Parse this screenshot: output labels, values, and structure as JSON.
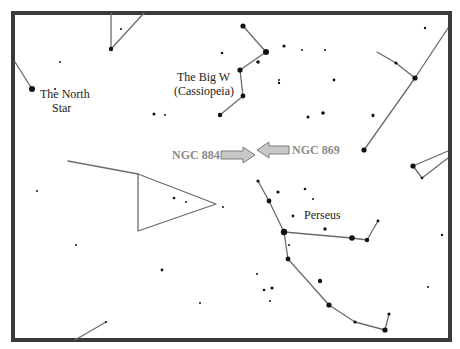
{
  "colors": {
    "frame": "#3a3a3a",
    "lines": "#6b6b6b",
    "stars": "#111111",
    "ngc_label": "#8a8a8a",
    "arrow_fill": "#c8c8c8"
  },
  "labels": {
    "north_star_line1": "The North",
    "north_star_line2": "Star",
    "cassiopeia_line1": "The Big W",
    "cassiopeia_line2": "(Cassiopeia)",
    "perseus": "Perseus",
    "ngc884": "NGC 884",
    "ngc869": "NGC 869"
  },
  "constellations": [
    {
      "name": "top-left-segment",
      "points": [
        [
          111,
          13
        ],
        [
          111,
          49
        ],
        [
          144,
          13
        ]
      ]
    },
    {
      "name": "north-star-line",
      "points": [
        [
          15,
          62
        ],
        [
          32,
          89
        ]
      ]
    },
    {
      "name": "cassiopeia",
      "points": [
        [
          243,
          26
        ],
        [
          266,
          52
        ],
        [
          240,
          70
        ],
        [
          243,
          96
        ],
        [
          220,
          115
        ]
      ]
    },
    {
      "name": "right-top",
      "points": [
        [
          377,
          52
        ],
        [
          396,
          63
        ],
        [
          415,
          78
        ]
      ]
    },
    {
      "name": "right-long",
      "points": [
        [
          448,
          28
        ],
        [
          415,
          78
        ],
        [
          364,
          150
        ]
      ]
    },
    {
      "name": "right-middle",
      "points": [
        [
          448,
          151
        ],
        [
          413,
          166
        ],
        [
          422,
          178
        ],
        [
          448,
          158
        ]
      ]
    },
    {
      "name": "left-line",
      "points": [
        [
          68,
          161
        ],
        [
          138,
          174
        ]
      ]
    },
    {
      "name": "triangle",
      "points": [
        [
          138,
          174
        ],
        [
          216,
          204
        ],
        [
          138,
          231
        ],
        [
          138,
          174
        ]
      ]
    },
    {
      "name": "perseus-arm",
      "points": [
        [
          258,
          181
        ],
        [
          269,
          201
        ],
        [
          284,
          232
        ],
        [
          352,
          238
        ],
        [
          367,
          240
        ],
        [
          378,
          221
        ]
      ]
    },
    {
      "name": "perseus-lower",
      "points": [
        [
          284,
          232
        ],
        [
          288,
          259
        ],
        [
          329,
          305
        ],
        [
          355,
          322
        ],
        [
          385,
          330
        ],
        [
          389,
          314
        ]
      ]
    },
    {
      "name": "bottom-left",
      "points": [
        [
          75,
          340
        ],
        [
          106,
          322
        ]
      ]
    }
  ],
  "stars": [
    {
      "x": 32,
      "y": 89,
      "r": 3
    },
    {
      "x": 111,
      "y": 49,
      "r": 2.2
    },
    {
      "x": 243,
      "y": 26,
      "r": 2.6
    },
    {
      "x": 266,
      "y": 52,
      "r": 3
    },
    {
      "x": 240,
      "y": 70,
      "r": 2.6
    },
    {
      "x": 243,
      "y": 96,
      "r": 2.4
    },
    {
      "x": 220,
      "y": 115,
      "r": 2.2
    },
    {
      "x": 258,
      "y": 62,
      "r": 1.8
    },
    {
      "x": 222,
      "y": 53,
      "r": 1.3
    },
    {
      "x": 284,
      "y": 46,
      "r": 1.6
    },
    {
      "x": 279,
      "y": 83,
      "r": 1.2
    },
    {
      "x": 154,
      "y": 114,
      "r": 1.5
    },
    {
      "x": 165,
      "y": 115,
      "r": 1
    },
    {
      "x": 308,
      "y": 117,
      "r": 1.5
    },
    {
      "x": 323,
      "y": 113,
      "r": 1.8
    },
    {
      "x": 373,
      "y": 115,
      "r": 1.5
    },
    {
      "x": 279,
      "y": 80,
      "r": 1
    },
    {
      "x": 334,
      "y": 80,
      "r": 1.4
    },
    {
      "x": 302,
      "y": 50,
      "r": 1
    },
    {
      "x": 325,
      "y": 50,
      "r": 1
    },
    {
      "x": 396,
      "y": 63,
      "r": 1.6
    },
    {
      "x": 415,
      "y": 78,
      "r": 2.6
    },
    {
      "x": 364,
      "y": 150,
      "r": 2.6
    },
    {
      "x": 413,
      "y": 166,
      "r": 2.6
    },
    {
      "x": 422,
      "y": 178,
      "r": 1.3
    },
    {
      "x": 425,
      "y": 28,
      "r": 1.2
    },
    {
      "x": 373,
      "y": 116,
      "r": 1.3
    },
    {
      "x": 258,
      "y": 181,
      "r": 1.6
    },
    {
      "x": 269,
      "y": 201,
      "r": 2.4
    },
    {
      "x": 284,
      "y": 232,
      "r": 3.2
    },
    {
      "x": 352,
      "y": 238,
      "r": 2.8
    },
    {
      "x": 367,
      "y": 240,
      "r": 2.2
    },
    {
      "x": 378,
      "y": 221,
      "r": 1.4
    },
    {
      "x": 288,
      "y": 259,
      "r": 2.4
    },
    {
      "x": 329,
      "y": 305,
      "r": 2.6
    },
    {
      "x": 355,
      "y": 322,
      "r": 1.6
    },
    {
      "x": 385,
      "y": 330,
      "r": 2.6
    },
    {
      "x": 389,
      "y": 314,
      "r": 1.6
    },
    {
      "x": 278,
      "y": 192,
      "r": 1.6
    },
    {
      "x": 305,
      "y": 189,
      "r": 1.3
    },
    {
      "x": 293,
      "y": 216,
      "r": 1.4
    },
    {
      "x": 325,
      "y": 229,
      "r": 1.7
    },
    {
      "x": 320,
      "y": 281,
      "r": 2.2
    },
    {
      "x": 264,
      "y": 290,
      "r": 1.3
    },
    {
      "x": 272,
      "y": 288,
      "r": 1.6
    },
    {
      "x": 257,
      "y": 274,
      "r": 1
    },
    {
      "x": 289,
      "y": 245,
      "r": 1
    },
    {
      "x": 442,
      "y": 235,
      "r": 1.2
    },
    {
      "x": 428,
      "y": 287,
      "r": 1
    },
    {
      "x": 162,
      "y": 270,
      "r": 1.4
    },
    {
      "x": 174,
      "y": 198,
      "r": 1.3
    },
    {
      "x": 186,
      "y": 202,
      "r": 1
    },
    {
      "x": 223,
      "y": 207,
      "r": 1
    },
    {
      "x": 37,
      "y": 191,
      "r": 1
    },
    {
      "x": 76,
      "y": 245,
      "r": 1
    },
    {
      "x": 60,
      "y": 62,
      "r": 1
    },
    {
      "x": 121,
      "y": 29,
      "r": 1
    },
    {
      "x": 55,
      "y": 89,
      "r": 1
    },
    {
      "x": 106,
      "y": 322,
      "r": 1.1
    },
    {
      "x": 200,
      "y": 303,
      "r": 1
    },
    {
      "x": 270,
      "y": 301,
      "r": 1
    },
    {
      "x": 313,
      "y": 199,
      "r": 1
    }
  ],
  "arrows": [
    {
      "name": "ngc884-arrow",
      "direction": "right",
      "x1": 221,
      "x2": 255,
      "y": 155
    },
    {
      "name": "ngc869-arrow",
      "direction": "left",
      "x1": 289,
      "x2": 257,
      "y": 150
    }
  ]
}
